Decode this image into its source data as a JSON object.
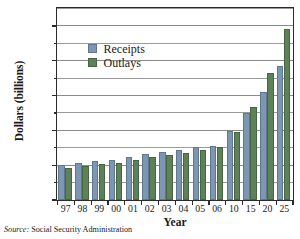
{
  "figure": {
    "source_prefix": "Source:",
    "source_text": "Social Security Administration"
  },
  "colors": {
    "receipts": "#7d96b2",
    "outlays": "#5d8159",
    "axis": "#2b2b2b",
    "grid": "#9a9a9a",
    "background": "#ffffff"
  },
  "legend": {
    "position": "inside-top-left",
    "entries": [
      {
        "label": "Receipts",
        "color": "#7d96b2"
      },
      {
        "label": "Outlays",
        "color": "#5d8159"
      }
    ]
  },
  "chart_data": {
    "type": "bar",
    "title": "",
    "xlabel": "Year",
    "ylabel": "Dollars (billions)",
    "categories": [
      "97",
      "98",
      "99",
      "00",
      "01",
      "02",
      "03",
      "04",
      "05",
      "06",
      "10",
      "15",
      "20",
      "25"
    ],
    "series": [
      {
        "name": "Receipts",
        "color": "#7d96b2",
        "values": [
          400,
          425,
          450,
          465,
          500,
          525,
          550,
          575,
          605,
          625,
          790,
          1005,
          1245,
          1540
        ]
      },
      {
        "name": "Outlays",
        "color": "#5d8159",
        "values": [
          365,
          395,
          415,
          430,
          465,
          490,
          515,
          545,
          575,
          605,
          785,
          1065,
          1455,
          1960
        ]
      }
    ],
    "ylim": [
      0,
      2200
    ],
    "ytick_labels": [
      "0",
      "$400",
      "$800",
      "$1200",
      "$1600",
      "$2000"
    ],
    "ytick_values": [
      0,
      400,
      800,
      1200,
      1600,
      2000
    ],
    "yminor_values": [
      200,
      600,
      1000,
      1400,
      1800,
      2200
    ],
    "grid": true,
    "legend_position": "upper left inside"
  }
}
